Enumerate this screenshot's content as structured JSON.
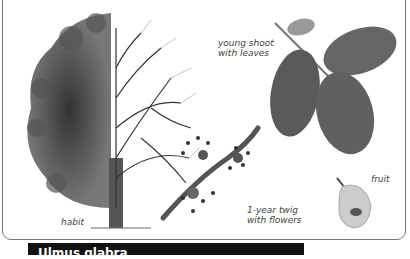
{
  "illustration": {
    "labels": {
      "habit": "habit",
      "young_shoot": "young shoot\nwith leaves",
      "twig": "1-year twig\nwith flowers",
      "fruit": "fruit"
    }
  },
  "title_bar": {
    "text": "Ulmus glabra",
    "color": "#111111"
  }
}
